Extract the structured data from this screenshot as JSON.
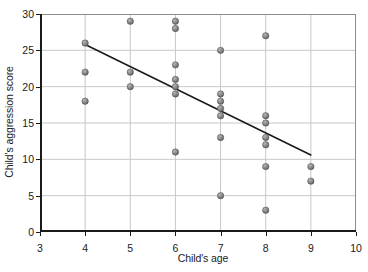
{
  "chart_data": {
    "type": "scatter",
    "title": "",
    "xlabel": "Child's age",
    "ylabel": "Child's aggression score",
    "xlim": [
      3,
      10
    ],
    "ylim": [
      0,
      30
    ],
    "xticks": [
      3,
      4,
      5,
      6,
      7,
      8,
      9,
      10
    ],
    "yticks": [
      0,
      5,
      10,
      15,
      20,
      25,
      30
    ],
    "grid": true,
    "legend": "none",
    "marker_color": "#808080",
    "marker_edge_color": "#4d4d4d",
    "line_color": "#1a1a1a",
    "grid_color": "#c8c8c8",
    "axis_color": "#1a1a1a",
    "points": [
      {
        "x": 4,
        "y": 26
      },
      {
        "x": 4,
        "y": 22
      },
      {
        "x": 4,
        "y": 18
      },
      {
        "x": 5,
        "y": 29
      },
      {
        "x": 5,
        "y": 22
      },
      {
        "x": 5,
        "y": 20
      },
      {
        "x": 6,
        "y": 29
      },
      {
        "x": 6,
        "y": 28
      },
      {
        "x": 6,
        "y": 23
      },
      {
        "x": 6,
        "y": 21
      },
      {
        "x": 6,
        "y": 20
      },
      {
        "x": 6,
        "y": 19
      },
      {
        "x": 6,
        "y": 11
      },
      {
        "x": 7,
        "y": 25
      },
      {
        "x": 7,
        "y": 19
      },
      {
        "x": 7,
        "y": 18
      },
      {
        "x": 7,
        "y": 17
      },
      {
        "x": 7,
        "y": 16
      },
      {
        "x": 7,
        "y": 13
      },
      {
        "x": 7,
        "y": 5
      },
      {
        "x": 8,
        "y": 27
      },
      {
        "x": 8,
        "y": 16
      },
      {
        "x": 8,
        "y": 15
      },
      {
        "x": 8,
        "y": 13
      },
      {
        "x": 8,
        "y": 12
      },
      {
        "x": 8,
        "y": 9
      },
      {
        "x": 8,
        "y": 3
      },
      {
        "x": 9,
        "y": 9
      },
      {
        "x": 9,
        "y": 7
      }
    ],
    "trendline": {
      "x0": 4,
      "y0": 25.8,
      "x1": 9,
      "y1": 10.6
    }
  }
}
